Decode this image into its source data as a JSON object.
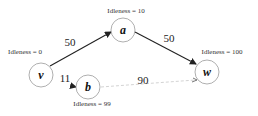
{
  "diagram": {
    "nodes": [
      {
        "id": "v",
        "label": "v",
        "idleness": "Idleness = 0",
        "x": 41,
        "y": 75
      },
      {
        "id": "a",
        "label": "a",
        "idleness": "Idleness = 10",
        "x": 123,
        "y": 30
      },
      {
        "id": "w",
        "label": "w",
        "idleness": "Idleness = 100",
        "x": 207,
        "y": 72
      },
      {
        "id": "b",
        "label": "b",
        "idleness": "Idleness = 99",
        "x": 88,
        "y": 87
      }
    ],
    "edges": [
      {
        "from": "v",
        "to": "a",
        "weight": "50",
        "style": "solid"
      },
      {
        "from": "a",
        "to": "w",
        "weight": "50",
        "style": "solid"
      },
      {
        "from": "v",
        "to": "b",
        "weight": "11",
        "style": "solid"
      },
      {
        "from": "b",
        "to": "w",
        "weight": "90",
        "style": "faint"
      }
    ]
  }
}
